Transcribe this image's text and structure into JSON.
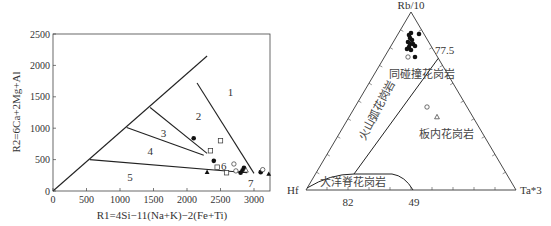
{
  "chart_data": [
    {
      "type": "scatter",
      "title": "",
      "xlabel": "R1=4Si−11(Na+K)−2(Fe+Ti)",
      "ylabel": "R2=6Ca+2Mg+Al",
      "xlim": [
        0,
        3250
      ],
      "ylim": [
        0,
        2500
      ],
      "xticks": [
        0,
        500,
        1000,
        1500,
        2000,
        2500,
        3000
      ],
      "yticks": [
        0,
        500,
        1000,
        1500,
        2000,
        2500
      ],
      "grid": false,
      "field_lines": [
        {
          "from": [
            0,
            0
          ],
          "to": [
            2300,
            2150
          ]
        },
        {
          "from": [
            2150,
            1720
          ],
          "to": [
            3000,
            280
          ]
        },
        {
          "from": [
            1450,
            1330
          ],
          "to": [
            2300,
            600
          ]
        },
        {
          "from": [
            1100,
            1010
          ],
          "to": [
            2250,
            570
          ]
        },
        {
          "from": [
            550,
            500
          ],
          "to": [
            2900,
            290
          ]
        }
      ],
      "region_labels": [
        {
          "label": "1",
          "x": 2650,
          "y": 1570
        },
        {
          "label": "2",
          "x": 2170,
          "y": 1200
        },
        {
          "label": "3",
          "x": 1650,
          "y": 920
        },
        {
          "label": "4",
          "x": 1450,
          "y": 640
        },
        {
          "label": "5",
          "x": 1150,
          "y": 230
        },
        {
          "label": "6",
          "x": 2550,
          "y": 400
        },
        {
          "label": "7",
          "x": 2950,
          "y": 130
        }
      ],
      "series": [
        {
          "name": "filled-circle",
          "marker": "circle-filled",
          "points": [
            [
              2100,
              840
            ],
            [
              2400,
              480
            ],
            [
              2800,
              290
            ],
            [
              2850,
              370
            ],
            [
              3100,
              300
            ],
            [
              2830,
              330
            ]
          ]
        },
        {
          "name": "open-square",
          "marker": "square-open",
          "points": [
            [
              2350,
              640
            ],
            [
              2500,
              800
            ],
            [
              2450,
              380
            ],
            [
              2590,
              290
            ]
          ]
        },
        {
          "name": "open-circle",
          "marker": "circle-open",
          "points": [
            [
              2700,
              430
            ],
            [
              2730,
              320
            ],
            [
              3130,
              340
            ]
          ]
        },
        {
          "name": "filled-triangle",
          "marker": "triangle-filled",
          "points": [
            [
              2300,
              300
            ],
            [
              3220,
              270
            ],
            [
              2860,
              320
            ]
          ]
        },
        {
          "name": "open-triangle",
          "marker": "triangle-open",
          "points": [
            [
              2880,
              330
            ]
          ]
        }
      ]
    },
    {
      "type": "ternary",
      "title": "",
      "apices": {
        "top": "Rb/10",
        "left": "Hf",
        "right": "Ta*3"
      },
      "base_tick_labels": [
        {
          "label": "82",
          "pos": 0.22
        },
        {
          "label": "49",
          "pos": 0.52
        }
      ],
      "edge_label": {
        "label": "77.5",
        "edge": "right",
        "pos": 0.26
      },
      "field_labels": [
        {
          "label": "同碰撞花岗岩",
          "x": 422,
          "y": 76,
          "rotate": 0
        },
        {
          "label": "火山弧花岗岩",
          "x": 379,
          "y": 110,
          "rotate": -62
        },
        {
          "label": "板内花岗岩",
          "x": 445,
          "y": 137,
          "rotate": 0
        },
        {
          "label": "大洋脊花岗岩",
          "x": 352,
          "y": 185,
          "rotate": 0
        }
      ],
      "series": [
        {
          "name": "filled-circle",
          "marker": "circle-filled",
          "points_px": [
            [
              409,
              35
            ],
            [
              411,
              33
            ],
            [
              410,
              38
            ],
            [
              412,
              40
            ],
            [
              408,
              42
            ],
            [
              413,
              44
            ],
            [
              409,
              47
            ],
            [
              415,
              46
            ],
            [
              411,
              50
            ],
            [
              407,
              49
            ],
            [
              410,
              44
            ],
            [
              419,
              34
            ],
            [
              415,
              57
            ]
          ]
        },
        {
          "name": "open-circle",
          "marker": "circle-open",
          "points_px": [
            [
              408,
              57
            ],
            [
              427,
              107
            ]
          ]
        },
        {
          "name": "open-triangle",
          "marker": "triangle-open",
          "points_px": [
            [
              437,
              117
            ]
          ]
        }
      ]
    }
  ],
  "left_chart": {
    "x_axis_label": "R1=4Si−11(Na+K)−2(Fe+Ti)",
    "y_axis_label": "R2=6Ca+2Mg+Al",
    "x_tick_labels": [
      "0",
      "500",
      "1000",
      "1500",
      "2000",
      "2500",
      "3000"
    ],
    "y_tick_labels": [
      "0",
      "500",
      "1000",
      "1500",
      "2000",
      "2500"
    ],
    "region_labels": [
      "1",
      "2",
      "3",
      "4",
      "5",
      "6",
      "7"
    ]
  },
  "right_chart": {
    "apex_top": "Rb/10",
    "apex_left": "Hf",
    "apex_right": "Ta*3",
    "tick_82": "82",
    "tick_49": "49",
    "tick_775": "77.5",
    "field_syn_collision": "同碰撞花岗岩",
    "field_volcanic_arc": "火山弧花岗岩",
    "field_within_plate": "板内花岗岩",
    "field_ocean_ridge": "大洋脊花岗岩"
  }
}
